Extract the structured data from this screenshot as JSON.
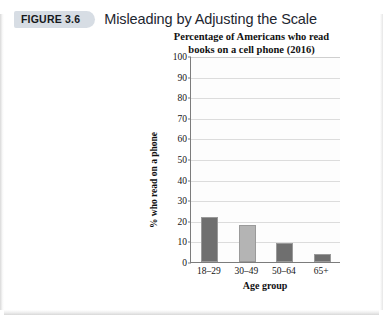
{
  "figure": {
    "number_label": "FIGURE 3.6",
    "caption": "Misleading by Adjusting the Scale"
  },
  "chart_data": {
    "type": "bar",
    "title": "Percentage of Americans who read\nbooks on a cell phone (2016)",
    "title_line1": "Percentage of Americans who read",
    "title_line2": "books on a cell phone (2016)",
    "categories": [
      "18–29",
      "30–49",
      "50–64",
      "65+"
    ],
    "values": [
      22,
      18,
      9,
      4
    ],
    "series": [
      {
        "name": "% who read on a phone",
        "values": [
          22,
          18,
          9,
          4
        ]
      }
    ],
    "xlabel": "Age group",
    "ylabel": "% who read on a phone",
    "ylim": [
      0,
      100
    ],
    "ytick_values": [
      0,
      10,
      20,
      30,
      40,
      50,
      60,
      70,
      80,
      90,
      100
    ],
    "ytick_labels": [
      "0",
      "10",
      "20",
      "30",
      "40",
      "50",
      "60",
      "70",
      "80",
      "90",
      "100"
    ],
    "grid": true,
    "grid_axis": "y",
    "legend": false,
    "bar_colors": [
      "#6f6f6f",
      "#b4b4b4",
      "#6f6f6f",
      "#6f6f6f"
    ],
    "plot_background": "#fdfdfd",
    "gridline_color": "#dcdcdc",
    "axis_color": "#7c7c7c"
  },
  "theme": {
    "badge_background": "#d7dde4",
    "caption_color": "#1d2630",
    "page_background": "#ffffff"
  }
}
